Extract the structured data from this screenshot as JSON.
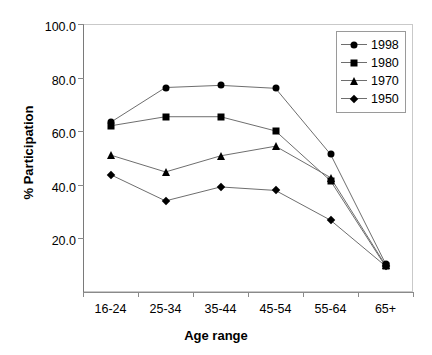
{
  "chart_data": {
    "type": "line",
    "title": "",
    "xlabel": "Age range",
    "ylabel": "% Participation",
    "categories": [
      "16-24",
      "25-34",
      "35-44",
      "45-54",
      "55-64",
      "65+"
    ],
    "ylim": [
      0,
      100
    ],
    "ytick_labels": [
      "100.0",
      "80.0",
      "60.0",
      "40.0",
      "20.0"
    ],
    "ytick_values": [
      100,
      80,
      60,
      40,
      20
    ],
    "grid": false,
    "legend_position": "top-right",
    "series": [
      {
        "name": "1998",
        "marker": "circle",
        "values": [
          63.3,
          76.3,
          77.1,
          76.0,
          51.4,
          10.6
        ]
      },
      {
        "name": "1980",
        "marker": "square",
        "values": [
          62.0,
          65.4,
          65.4,
          60.1,
          41.5,
          9.6
        ]
      },
      {
        "name": "1970",
        "marker": "triangle",
        "values": [
          51.1,
          44.8,
          50.8,
          54.4,
          42.7,
          10.0
        ]
      },
      {
        "name": "1950",
        "marker": "diamond",
        "values": [
          43.8,
          34.0,
          39.2,
          37.9,
          26.8,
          9.7
        ]
      }
    ]
  },
  "axis": {
    "x_title": "Age range",
    "y_title": "% Participation"
  },
  "legend": {
    "entries": [
      {
        "label": "1998"
      },
      {
        "label": "1980"
      },
      {
        "label": "1970"
      },
      {
        "label": "1950"
      }
    ]
  }
}
